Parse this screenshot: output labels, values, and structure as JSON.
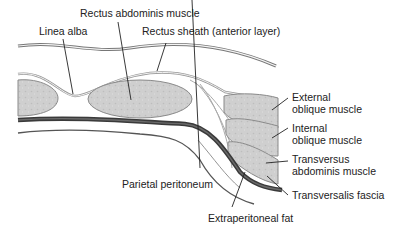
{
  "figure": {
    "type": "anatomical cross-section",
    "colors": {
      "muscle_fill": "#cfcfcf",
      "muscle_outline": "#8a8a8a",
      "transversalis_fascia": "#3a3a3a",
      "line": "#222222",
      "background": "#ffffff"
    }
  },
  "labels": {
    "rectus_abdominis": "Rectus abdominis muscle",
    "linea_alba": "Linea alba",
    "rectus_sheath": "Rectus sheath (anterior layer)",
    "external_oblique_1": "External",
    "external_oblique_2": "oblique muscle",
    "internal_oblique_1": "Internal",
    "internal_oblique_2": "oblique muscle",
    "transversus_1": "Transversus",
    "transversus_2": "abdominis muscle",
    "transversalis_fascia": "Transversalis fascia",
    "parietal_peritoneum": "Parietal peritoneum",
    "extraperitoneal_fat": "Extraperitoneal fat"
  }
}
